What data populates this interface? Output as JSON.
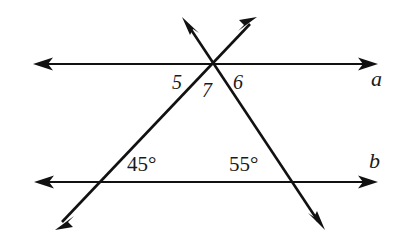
{
  "figure": {
    "background_color": "#ffffff",
    "stroke_color": "#111111",
    "width": 409,
    "height": 243
  },
  "lines": [
    {
      "name": "line-a",
      "label": "a",
      "orientation": "horizontal",
      "y": 64,
      "x_start": 33,
      "x_end": 378,
      "arrows": "both",
      "label_x": 371,
      "label_y": 68
    },
    {
      "name": "line-b",
      "label": "b",
      "orientation": "horizontal",
      "y": 182,
      "x_start": 34,
      "x_end": 378,
      "arrows": "both",
      "label_x": 369,
      "label_y": 150
    },
    {
      "name": "transversal-left",
      "label": "",
      "orientation": "rising",
      "x_start": 55,
      "y_start": 230,
      "x_end": 257,
      "y_end": 17,
      "arrows": "both"
    },
    {
      "name": "transversal-right",
      "label": "",
      "orientation": "falling",
      "x_start": 182,
      "y_start": 17,
      "x_end": 325,
      "y_end": 230,
      "arrows": "both"
    }
  ],
  "intersections": [
    {
      "name": "apex",
      "x": 212,
      "y": 64,
      "description": "both transversals meet line a"
    },
    {
      "name": "left-base",
      "x": 101,
      "y": 182,
      "description": "left transversal meets line b"
    },
    {
      "name": "right-base",
      "x": 293,
      "y": 182,
      "description": "right transversal meets line b"
    }
  ],
  "labels": {
    "angle_5": "5",
    "angle_7": "7",
    "angle_6": "6",
    "angle_45": "45°",
    "angle_55": "55°",
    "line_a": "a",
    "line_b": "b"
  }
}
